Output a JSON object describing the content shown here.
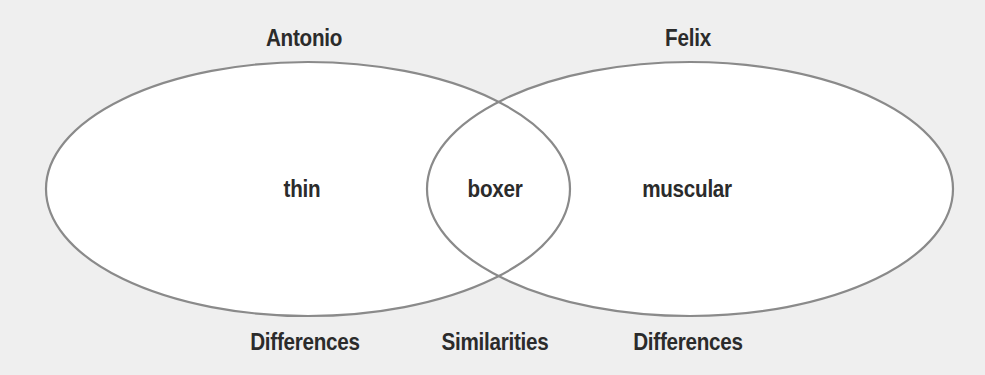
{
  "diagram": {
    "type": "venn",
    "sets": [
      {
        "name": "Antonio",
        "unique_traits": [
          "thin"
        ]
      },
      {
        "name": "Felix",
        "unique_traits": [
          "muscular"
        ]
      }
    ],
    "overlap": [
      "boxer"
    ],
    "bottom_labels": {
      "left": "Differences",
      "center": "Similarities",
      "right": "Differences"
    },
    "colors": {
      "background": "#efefef",
      "fill": "#ffffff",
      "stroke": "#8a8a8a",
      "text": "#2b2b2b"
    }
  }
}
